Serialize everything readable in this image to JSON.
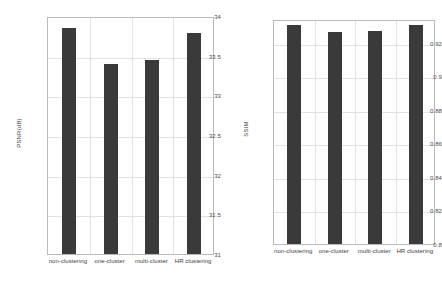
{
  "chart_data": [
    {
      "id": "psnr-chart",
      "type": "bar",
      "title": "",
      "xlabel": "",
      "ylabel": "PSNR(dB)",
      "categories": [
        "non-clustering",
        "one-cluster",
        "multi-cluster",
        "HR clustering"
      ],
      "values": [
        33.85,
        33.39,
        33.45,
        33.78
      ],
      "ylim": [
        31,
        34
      ],
      "yticks": [
        31,
        31.5,
        32,
        32.5,
        33,
        33.5,
        34
      ],
      "ytick_labels": [
        "31",
        "31.5",
        "32",
        "32.5",
        "33",
        "33.5",
        "34"
      ],
      "grid": true,
      "legend": "none",
      "bar_color": "#3a3a3a"
    },
    {
      "id": "ssim-chart",
      "type": "bar",
      "title": "",
      "xlabel": "",
      "ylabel": "SSIM",
      "categories": [
        "non-clustering",
        "one-cluster",
        "multi-cluster",
        "HR clustering"
      ],
      "values": [
        0.9307,
        0.9263,
        0.9269,
        0.9305
      ],
      "ylim": [
        0.8,
        0.9341
      ],
      "yticks": [
        0.8,
        0.82,
        0.84,
        0.86,
        0.88,
        0.9,
        0.92
      ],
      "ytick_labels": [
        "0.8",
        "0.82",
        "0.84",
        "0.86",
        "0.88",
        "0.9",
        "0.92"
      ],
      "grid": true,
      "legend": "none",
      "bar_color": "#3a3a3a"
    }
  ]
}
